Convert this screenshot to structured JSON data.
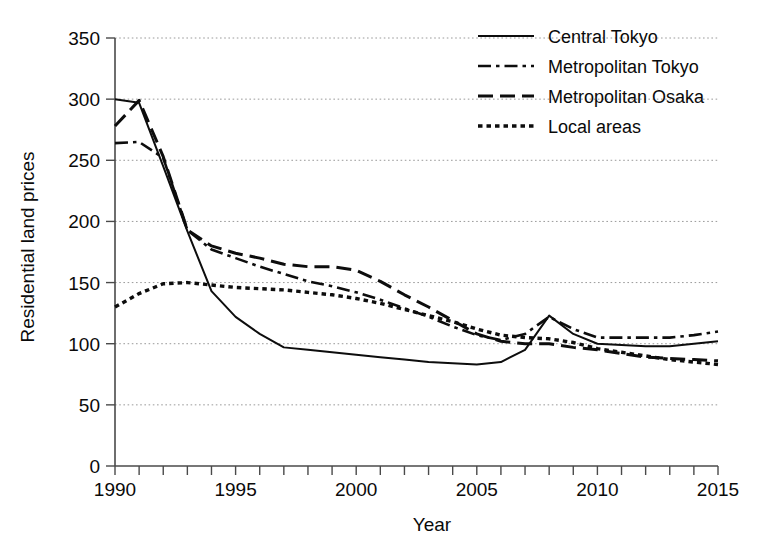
{
  "chart_data": {
    "type": "line",
    "title": "",
    "xlabel": "Year",
    "ylabel": "Residential land prices",
    "xlim": [
      1990,
      2015
    ],
    "ylim": [
      0,
      350
    ],
    "ytick_step": 50,
    "xtick_step": 1,
    "xtick_label_step": 5,
    "grid": true,
    "legend_position": "top-right",
    "ytick_labels": [
      "0",
      "50",
      "100",
      "150",
      "200",
      "250",
      "300",
      "350"
    ],
    "yticks": [
      0,
      50,
      100,
      150,
      200,
      250,
      300,
      350
    ],
    "xtick_labels": [
      "1990",
      "1995",
      "2000",
      "2005",
      "2010",
      "2015"
    ],
    "xticks": [
      1990,
      1995,
      2000,
      2005,
      2010,
      2015
    ],
    "x": [
      1990,
      1991,
      1992,
      1993,
      1994,
      1995,
      1996,
      1997,
      1998,
      1999,
      2000,
      2001,
      2002,
      2003,
      2004,
      2005,
      2006,
      2007,
      2008,
      2009,
      2010,
      2011,
      2012,
      2013,
      2014,
      2015
    ],
    "series": [
      {
        "name": "Central Tokyo",
        "style": "solid",
        "color": "#0d0d0d",
        "values": [
          300,
          297,
          245,
          192,
          143,
          122,
          108,
          97,
          95,
          93,
          91,
          89,
          87,
          85,
          84,
          83,
          85,
          95,
          123,
          108,
          100,
          99,
          98,
          98,
          100,
          102
        ]
      },
      {
        "name": "Metropolitan Tokyo",
        "style": "dashdot",
        "color": "#0d0d0d",
        "values": [
          264,
          265,
          252,
          193,
          177,
          170,
          163,
          157,
          151,
          147,
          142,
          136,
          129,
          122,
          114,
          107,
          103,
          108,
          122,
          112,
          105,
          105,
          105,
          105,
          107,
          110
        ]
      },
      {
        "name": "Metropolitan Osaka",
        "style": "dash",
        "color": "#0d0d0d",
        "values": [
          278,
          299,
          253,
          193,
          180,
          174,
          170,
          165,
          163,
          163,
          160,
          151,
          140,
          130,
          119,
          108,
          102,
          100,
          100,
          97,
          95,
          92,
          89,
          88,
          87,
          86
        ]
      },
      {
        "name": "Local areas",
        "style": "dot",
        "color": "#0d0d0d",
        "values": [
          130,
          141,
          149,
          150,
          148,
          146,
          145,
          144,
          142,
          140,
          137,
          133,
          128,
          123,
          118,
          112,
          107,
          105,
          104,
          101,
          96,
          93,
          90,
          87,
          85,
          83
        ]
      }
    ]
  },
  "legend": {
    "items": [
      {
        "label": "Central Tokyo",
        "style": "solid"
      },
      {
        "label": "Metropolitan Tokyo",
        "style": "dashdot"
      },
      {
        "label": "Metropolitan Osaka",
        "style": "dash"
      },
      {
        "label": "Local areas",
        "style": "dot"
      }
    ]
  }
}
